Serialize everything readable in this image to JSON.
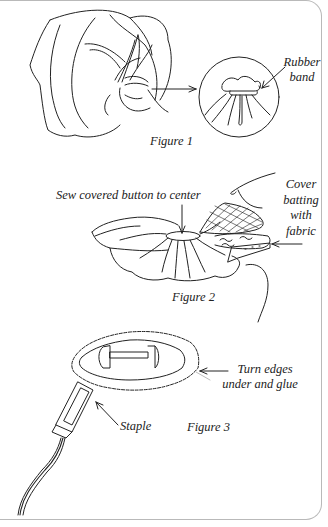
{
  "figures": [
    {
      "id": "figure-1",
      "caption": "Figure 1",
      "labels": [
        {
          "name": "rubber-band-label",
          "lines": [
            "Rubber",
            "band"
          ]
        }
      ]
    },
    {
      "id": "figure-2",
      "caption": "Figure 2",
      "labels": [
        {
          "name": "sew-button-label",
          "text": "Sew covered button to center"
        },
        {
          "name": "cover-batting-label",
          "lines": [
            "Cover",
            "batting",
            "with",
            "fabric"
          ]
        }
      ]
    },
    {
      "id": "figure-3",
      "caption": "Figure 3",
      "labels": [
        {
          "name": "turn-edges-label",
          "lines": [
            "Turn edges",
            "under and glue"
          ]
        },
        {
          "name": "staple-label",
          "text": "Staple"
        }
      ]
    }
  ],
  "colors": {
    "ink": "#222222",
    "border": "#b9b9b9",
    "background": "#ffffff"
  }
}
